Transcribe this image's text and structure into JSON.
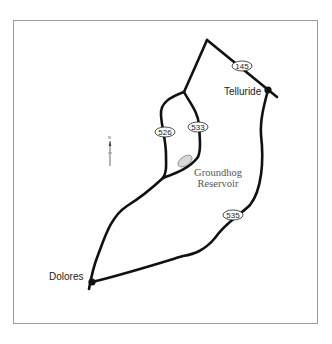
{
  "map": {
    "towns": [
      {
        "name": "Telluride",
        "x": 268,
        "y": 90
      },
      {
        "name": "Dolores",
        "x": 92,
        "y": 281
      }
    ],
    "routes": [
      {
        "number": "145",
        "x": 242,
        "y": 66
      },
      {
        "number": "526",
        "x": 165,
        "y": 132
      },
      {
        "number": "533",
        "x": 198,
        "y": 127
      },
      {
        "number": "535",
        "x": 233,
        "y": 215
      }
    ],
    "water": [
      {
        "name_line1": "Groundhog",
        "name_line2": "Reservoir"
      }
    ],
    "compass": {
      "label": "N"
    },
    "colors": {
      "road": "#111111",
      "water": "#d8d8d8",
      "border": "#9a9a9a"
    }
  }
}
